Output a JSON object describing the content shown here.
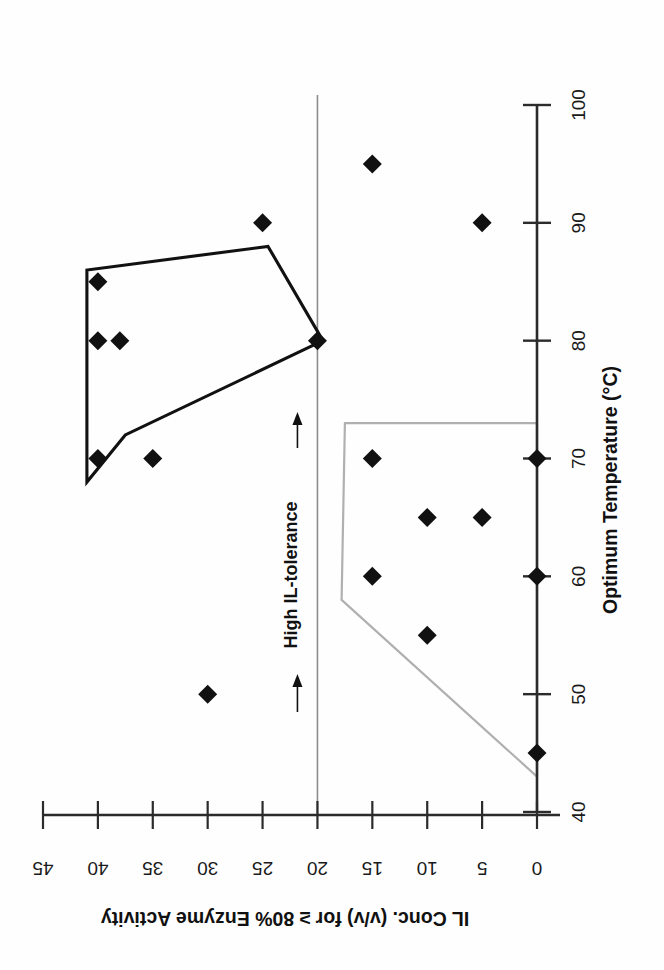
{
  "chart_data": {
    "type": "scatter",
    "title": "",
    "orientation": "rotated-180",
    "xlabel": "Optimum Temperature (°C)",
    "ylabel": "IL Conc. (v/v) for ≥ 80% Enzyme Activity",
    "xlim": [
      40,
      100
    ],
    "ylim": [
      0,
      45
    ],
    "xticks": [
      40,
      50,
      60,
      70,
      80,
      90,
      100
    ],
    "xtick_labels": [
      "40",
      "50",
      "60",
      "70",
      "80",
      "90",
      "100"
    ],
    "yticks": [
      0,
      5,
      10,
      15,
      20,
      25,
      30,
      35,
      40,
      45
    ],
    "ytick_labels": [
      "0",
      "5",
      "10",
      "15",
      "20",
      "25",
      "30",
      "35",
      "40",
      "45"
    ],
    "grid": false,
    "legend": "none",
    "reference_line": {
      "axis": "y",
      "value": 20,
      "color": "#8d8d8d",
      "label": "High IL-tolerance"
    },
    "annotations": [
      {
        "text": "← High IL-tolerance ←",
        "label_text": "High IL-tolerance",
        "arrow_glyph": "↑",
        "at_y": 20,
        "color": "#111111"
      }
    ],
    "series": [
      {
        "name": "high-IL-tolerance-group",
        "marker": "diamond",
        "color": "#111111",
        "hull_color": "#111111",
        "points": [
          {
            "x": 70,
            "y": 40
          },
          {
            "x": 70,
            "y": 35
          },
          {
            "x": 80,
            "y": 40
          },
          {
            "x": 80,
            "y": 38
          },
          {
            "x": 85,
            "y": 40
          },
          {
            "x": 90,
            "y": 25
          },
          {
            "x": 95,
            "y": 15
          },
          {
            "x": 80,
            "y": 20
          },
          {
            "x": 90,
            "y": 5
          },
          {
            "x": 50,
            "y": 30
          }
        ],
        "hull": [
          {
            "x": 68,
            "y": 41
          },
          {
            "x": 86,
            "y": 41
          },
          {
            "x": 88,
            "y": 24.5
          },
          {
            "x": 80,
            "y": 19.5
          },
          {
            "x": 72,
            "y": 37.5
          }
        ]
      },
      {
        "name": "low-IL-tolerance-group",
        "marker": "diamond",
        "color": "#111111",
        "hull_color": "#b0b0b0",
        "points": [
          {
            "x": 70,
            "y": 15
          },
          {
            "x": 70,
            "y": 0
          },
          {
            "x": 65,
            "y": 10
          },
          {
            "x": 65,
            "y": 5
          },
          {
            "x": 60,
            "y": 15
          },
          {
            "x": 60,
            "y": 0
          },
          {
            "x": 55,
            "y": 10
          },
          {
            "x": 45,
            "y": 0
          }
        ],
        "hull": [
          {
            "x": 73,
            "y": 17.5
          },
          {
            "x": 73,
            "y": 0
          },
          {
            "x": 43,
            "y": 0
          },
          {
            "x": 58,
            "y": 17.8
          }
        ]
      }
    ]
  },
  "figure": {
    "x_axis_title": "Optimum Temperature (°C)",
    "y_axis_title": "IL Conc. (v/v) for ≥ 80% Enzyme Activity",
    "annotation_text": "High IL-tolerance",
    "arrow_left": "←",
    "arrow_right": "←"
  }
}
